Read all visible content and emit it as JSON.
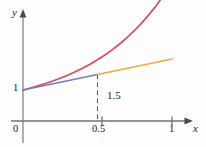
{
  "chart_data": {
    "type": "line",
    "title": "",
    "xlabel": "x",
    "ylabel": "y",
    "xlim": [
      0,
      1.12
    ],
    "ylim": [
      0,
      3.2
    ],
    "grid": false,
    "legend": null,
    "x_ticks": [
      {
        "value": 0.5,
        "label": "0.5"
      },
      {
        "value": 1,
        "label": "1"
      }
    ],
    "y_ticks": [
      {
        "value": 1,
        "label": "1"
      }
    ],
    "origin_label": "0",
    "annotations": [
      {
        "name": "value-1-5",
        "text": "1.5",
        "x": 0.5,
        "y": 1.5
      }
    ],
    "series": [
      {
        "name": "curve",
        "color": "#d84a5e",
        "type": "curve",
        "x": [
          0,
          0.05,
          0.1,
          0.15,
          0.2,
          0.25,
          0.3,
          0.35,
          0.4,
          0.45,
          0.5,
          0.55,
          0.6,
          0.65,
          0.7,
          0.75,
          0.8,
          0.85,
          0.9,
          0.95,
          1.0
        ],
        "y": [
          1.0,
          1.064,
          1.133,
          1.208,
          1.29,
          1.38,
          1.478,
          1.586,
          1.704,
          1.833,
          1.975,
          2.131,
          2.303,
          2.492,
          2.7,
          2.928,
          3.18,
          3.456,
          3.76,
          4.095,
          4.463
        ]
      },
      {
        "name": "tangent-segment",
        "color": "#6d7fc4",
        "type": "segment",
        "x": [
          0,
          0.5
        ],
        "y": [
          1.0,
          1.5
        ]
      },
      {
        "name": "extension-segment",
        "color": "#f0a93c",
        "type": "segment",
        "x": [
          0.5,
          1.0
        ],
        "y": [
          1.5,
          2.0
        ]
      }
    ],
    "dashed_guide": {
      "name": "drop-line-at-0.5",
      "x": 0.5,
      "y_top": 1.5,
      "y_bottom": 0
    }
  }
}
